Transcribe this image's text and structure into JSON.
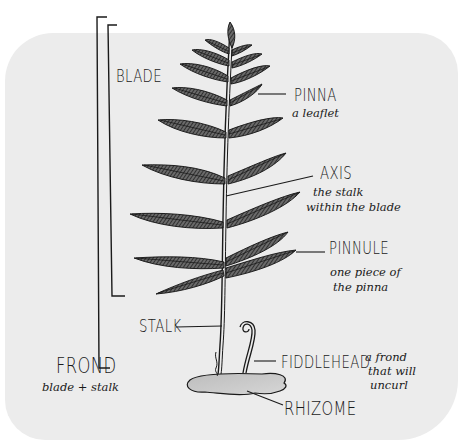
{
  "diagram": {
    "colors": {
      "background": "#ffffff",
      "card": "#ececec",
      "ink": "#1a1a1a",
      "rhizome_fill": "#c9c9c9"
    },
    "labels": {
      "blade": {
        "title": "BLADE"
      },
      "pinna": {
        "title": "PINNA",
        "note": "a leaflet"
      },
      "axis": {
        "title": "AXIS",
        "note_line1": "the stalk",
        "note_line2": "within the blade"
      },
      "pinnule": {
        "title": "PINNULE",
        "note_line1": "one piece of",
        "note_line2": "the pinna"
      },
      "stalk": {
        "title": "STALK"
      },
      "frond": {
        "title": "FROND",
        "note": "blade + stalk"
      },
      "fiddlehead": {
        "title": "FIDDLEHEAD",
        "note_line1": "a frond",
        "note_line2": "that will",
        "note_line3": "uncurl"
      },
      "rhizome": {
        "title": "RHIZOME"
      }
    }
  }
}
